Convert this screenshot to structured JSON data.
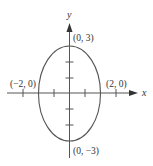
{
  "diagram": {
    "type": "ellipse-graph",
    "equation_shape": "vertical ellipse centered at origin",
    "axes": {
      "x_label": "x",
      "y_label": "y"
    },
    "points": [
      {
        "label": "(0, 3)",
        "x": 0,
        "y": 3
      },
      {
        "label": "(0, −3)",
        "x": 0,
        "y": -3
      },
      {
        "label": "(−2, 0)",
        "x": -2,
        "y": 0
      },
      {
        "label": "(2, 0)",
        "x": 2,
        "y": 0
      }
    ],
    "ellipse": {
      "center": [
        0,
        0
      ],
      "semi_major_y": 3,
      "semi_minor_x": 2
    },
    "x_ticks": [
      -3,
      -1,
      1,
      3
    ],
    "y_ticks": [
      -2,
      -1,
      1,
      2
    ],
    "colors": {
      "stroke": "#555555",
      "text": "#333333"
    }
  }
}
